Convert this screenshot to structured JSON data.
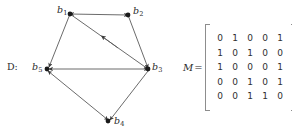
{
  "figure": {
    "graph": {
      "caption": "D:",
      "nodes": [
        {
          "id": "b1",
          "label": "b",
          "sub": "1",
          "x": 70,
          "y": 14
        },
        {
          "id": "b2",
          "label": "b",
          "sub": "2",
          "x": 128,
          "y": 15
        },
        {
          "id": "b3",
          "label": "b",
          "sub": "3",
          "x": 148,
          "y": 69
        },
        {
          "id": "b4",
          "label": "b",
          "sub": "4",
          "x": 108,
          "y": 121
        },
        {
          "id": "b5",
          "label": "b",
          "sub": "5",
          "x": 47,
          "y": 69
        }
      ],
      "edges": [
        {
          "from": "b1",
          "to": "b2",
          "arrows": "both"
        },
        {
          "from": "b1",
          "to": "b3",
          "arrows": "both",
          "mid_arrow": true
        },
        {
          "from": "b1",
          "to": "b5",
          "arrows": "forward"
        },
        {
          "from": "b2",
          "to": "b3",
          "arrows": "forward"
        },
        {
          "from": "b5",
          "to": "b3",
          "arrows": "both"
        },
        {
          "from": "b5",
          "to": "b4",
          "arrows": "both"
        },
        {
          "from": "b3",
          "to": "b4",
          "arrows": "forward"
        }
      ],
      "node_color": "#1a1a1a",
      "edge_color": "#4a4a4a"
    },
    "matrix": {
      "name": "M",
      "equals": "=",
      "bracket_color": "#8d8d8d",
      "rows": [
        [
          "0",
          "1",
          "0",
          "0",
          "1"
        ],
        [
          "1",
          "0",
          "1",
          "0",
          "0"
        ],
        [
          "1",
          "0",
          "0",
          "0",
          "1"
        ],
        [
          "0",
          "0",
          "1",
          "0",
          "1"
        ],
        [
          "0",
          "0",
          "1",
          "1",
          "0"
        ]
      ]
    }
  }
}
